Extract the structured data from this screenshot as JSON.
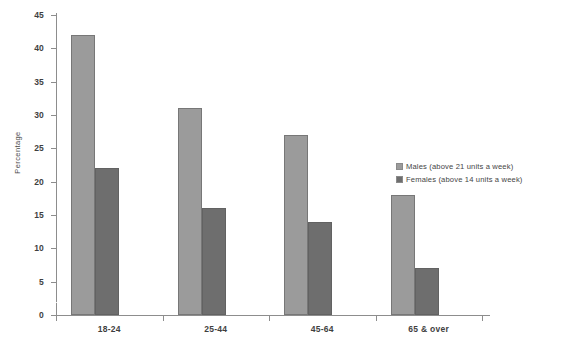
{
  "chart_data": {
    "type": "bar",
    "title": "",
    "xlabel": "",
    "ylabel": "Percentage",
    "categories": [
      "18-24",
      "25-44",
      "45-64",
      "65 & over"
    ],
    "series": [
      {
        "name": "Males (above 21 units a week)",
        "values": [
          42,
          31,
          27,
          18
        ],
        "color": "#9b9b9b"
      },
      {
        "name": "Females (above 14 units a week)",
        "values": [
          22,
          16,
          14,
          7
        ],
        "color": "#6e6e6e"
      }
    ],
    "ylim": [
      0,
      45
    ],
    "ytick_step": 5,
    "yticks": [
      0,
      5,
      10,
      15,
      20,
      25,
      30,
      35,
      40,
      45
    ],
    "ytick_labels": [
      "0",
      "5",
      "10",
      "15",
      "20",
      "25",
      "30",
      "35",
      "40",
      "45"
    ],
    "grid": "single faint white gridline near 2%",
    "gridline_values": [
      2
    ],
    "legend_position": "right-middle"
  },
  "legend": {
    "entries": [
      {
        "label": "Males (above 21 units a week)",
        "swatch": "males"
      },
      {
        "label": "Females (above 14 units a week)",
        "swatch": "females"
      }
    ]
  },
  "caption": {
    "text": ""
  }
}
